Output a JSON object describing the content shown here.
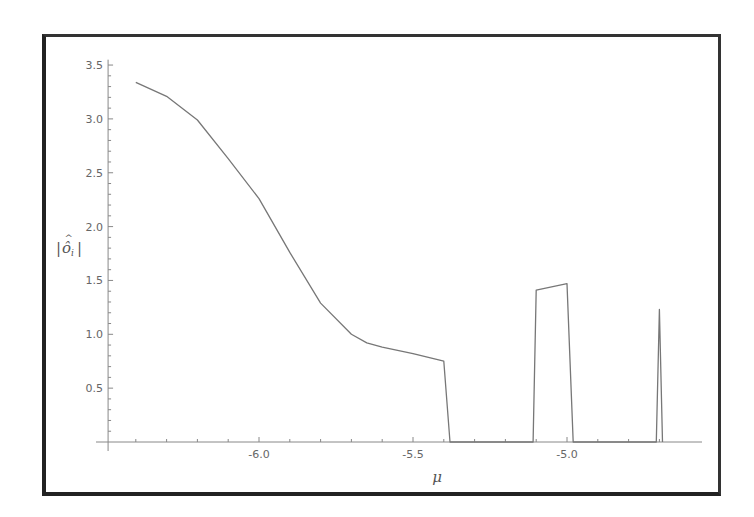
{
  "chart_data": {
    "type": "line",
    "title": "",
    "xlabel": "μ",
    "ylabel": "|ô_i|",
    "xlim": [
      -6.49,
      -4.6
    ],
    "ylim": [
      0,
      3.5
    ],
    "grid": false,
    "legend": null,
    "x_ticks": [
      -6.0,
      -5.5,
      -5.0
    ],
    "x_tick_labels": [
      "-6.0",
      "-5.5",
      "-5.0"
    ],
    "y_ticks": [
      0.5,
      1.0,
      1.5,
      2.0,
      2.5,
      3.0,
      3.5
    ],
    "y_tick_labels": [
      "0.5",
      "1.0",
      "1.5",
      "2.0",
      "2.5",
      "3.0",
      "3.5"
    ],
    "series": [
      {
        "name": "|ô_i|",
        "color": "#777777",
        "x": [
          -6.4,
          -6.3,
          -6.2,
          -6.1,
          -6.0,
          -5.9,
          -5.8,
          -5.7,
          -5.65,
          -5.6,
          -5.5,
          -5.4,
          -5.38,
          -5.11,
          -5.1,
          -5.0,
          -4.98,
          -4.71,
          -4.7,
          -4.69
        ],
        "y": [
          3.34,
          3.21,
          2.99,
          2.63,
          2.26,
          1.76,
          1.29,
          1.0,
          0.92,
          0.88,
          0.82,
          0.75,
          0.0,
          0.0,
          1.41,
          1.47,
          0.0,
          0.0,
          1.23,
          0.0
        ]
      }
    ]
  },
  "axes": {
    "x_label": "μ",
    "y_label_main": "ô",
    "y_label_sub": "i"
  }
}
